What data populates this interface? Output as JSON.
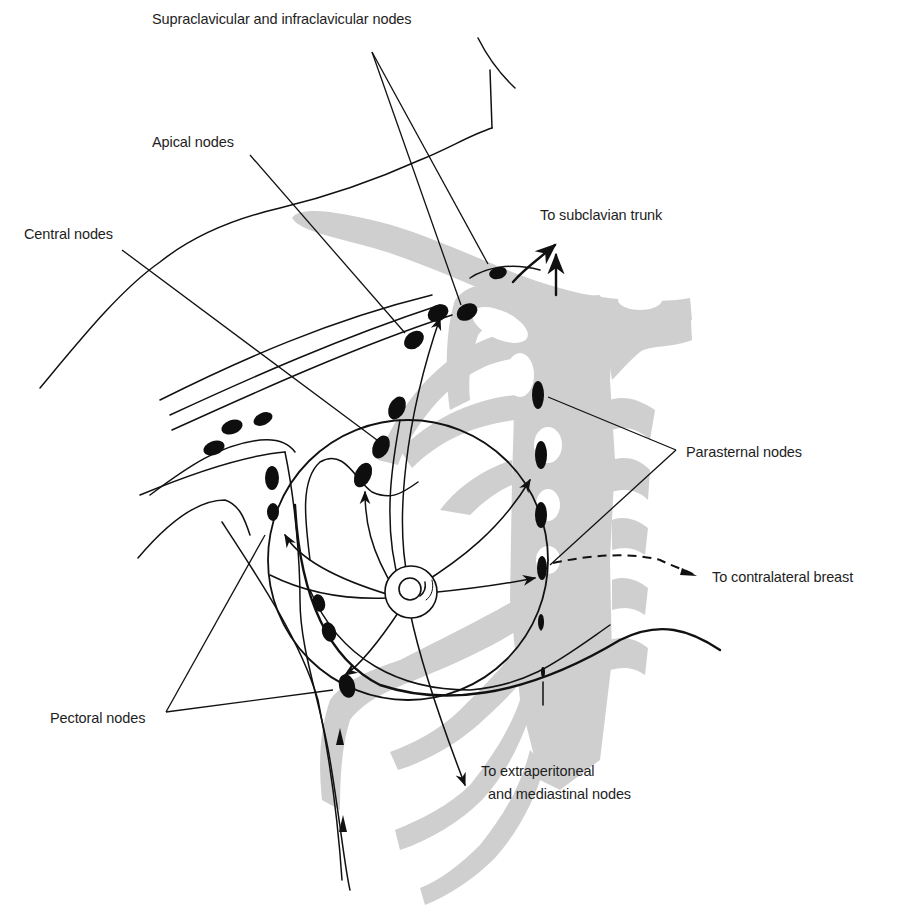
{
  "diagram": {
    "colors": {
      "line": "#111111",
      "node": "#0e0e0e",
      "bone": "#cfcfcf",
      "text": "#1e1e1e",
      "background": "#ffffff"
    },
    "labels": {
      "supraclavicular": "Supraclavicular and infraclavicular nodes",
      "apical": "Apical nodes",
      "central": "Central nodes",
      "subclavian": "To subclavian trunk",
      "parasternal": "Parasternal nodes",
      "contralateral": "To contralateral breast",
      "pectoral": "Pectoral nodes",
      "extraperitoneal_line1": "To extraperitoneal",
      "extraperitoneal_line2": "and mediastinal nodes"
    },
    "node_groups": [
      {
        "name": "Supraclavicular and infraclavicular nodes",
        "count": 2
      },
      {
        "name": "Apical nodes",
        "count": 2
      },
      {
        "name": "Central nodes",
        "count": 4
      },
      {
        "name": "Pectoral nodes",
        "count": 5
      },
      {
        "name": "Parasternal nodes",
        "count": 6
      }
    ],
    "drainage_targets": [
      "To subclavian trunk",
      "To contralateral breast",
      "To extraperitoneal and mediastinal nodes"
    ]
  }
}
